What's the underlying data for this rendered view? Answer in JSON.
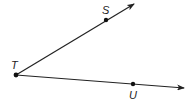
{
  "diagram": {
    "type": "angle",
    "vertex": {
      "label": "T",
      "x": 16,
      "y": 75
    },
    "rays": [
      {
        "name": "ray-TS",
        "through": {
          "label": "S",
          "x": 106,
          "y": 20
        },
        "tip": {
          "x": 134,
          "y": 4
        }
      },
      {
        "name": "ray-TU",
        "through": {
          "label": "U",
          "x": 133,
          "y": 84
        },
        "tip": {
          "x": 184,
          "y": 88
        }
      }
    ],
    "labels": {
      "T": "T",
      "S": "S",
      "U": "U"
    },
    "colors": {
      "line": "#222222",
      "background": "#ffffff"
    }
  }
}
